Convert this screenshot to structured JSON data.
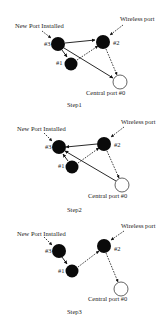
{
  "labels": {
    "new_port": "New Port Installed",
    "wireless_port": "Wireless port",
    "central_port": "Central port #0",
    "node1": "#1",
    "node2": "#2",
    "node3": "#3"
  },
  "steps": [
    {
      "title": "Step1",
      "nodes": {
        "n3": [
          58,
          44
        ],
        "n1": [
          71,
          64
        ],
        "n2": [
          103,
          42
        ],
        "n0": [
          120,
          82
        ]
      },
      "edges": [
        {
          "from": "n3",
          "to": "n2",
          "style": "solid"
        },
        {
          "from": "n3",
          "to": "n1",
          "style": "solid"
        },
        {
          "from": "n3",
          "to": "n0",
          "style": "solid"
        },
        {
          "from": "n1",
          "to": "n2",
          "style": "dashed"
        },
        {
          "from": "n2",
          "to": "n0",
          "style": "dashed"
        }
      ]
    },
    {
      "title": "Step2",
      "nodes": {
        "n3": [
          59,
          147
        ],
        "n1": [
          72,
          167
        ],
        "n2": [
          104,
          144
        ],
        "n0": [
          122,
          185
        ]
      },
      "edges": [
        {
          "from": "n2",
          "to": "n3",
          "style": "solid"
        },
        {
          "from": "n1",
          "to": "n3",
          "style": "solid"
        },
        {
          "from": "n0",
          "to": "n3",
          "style": "solid"
        },
        {
          "from": "n1",
          "to": "n2",
          "style": "dashed"
        },
        {
          "from": "n2",
          "to": "n0",
          "style": "dashed"
        }
      ]
    },
    {
      "title": "Step3",
      "nodes": {
        "n3": [
          59,
          251
        ],
        "n1": [
          72,
          271
        ],
        "n2": [
          104,
          246
        ],
        "n0": [
          121,
          289
        ]
      },
      "edges": [
        {
          "from": "n3",
          "to": "n1",
          "style": "solid"
        },
        {
          "from": "n1",
          "to": "n2",
          "style": "dashed"
        },
        {
          "from": "n2",
          "to": "n0",
          "style": "dashed"
        }
      ]
    }
  ]
}
